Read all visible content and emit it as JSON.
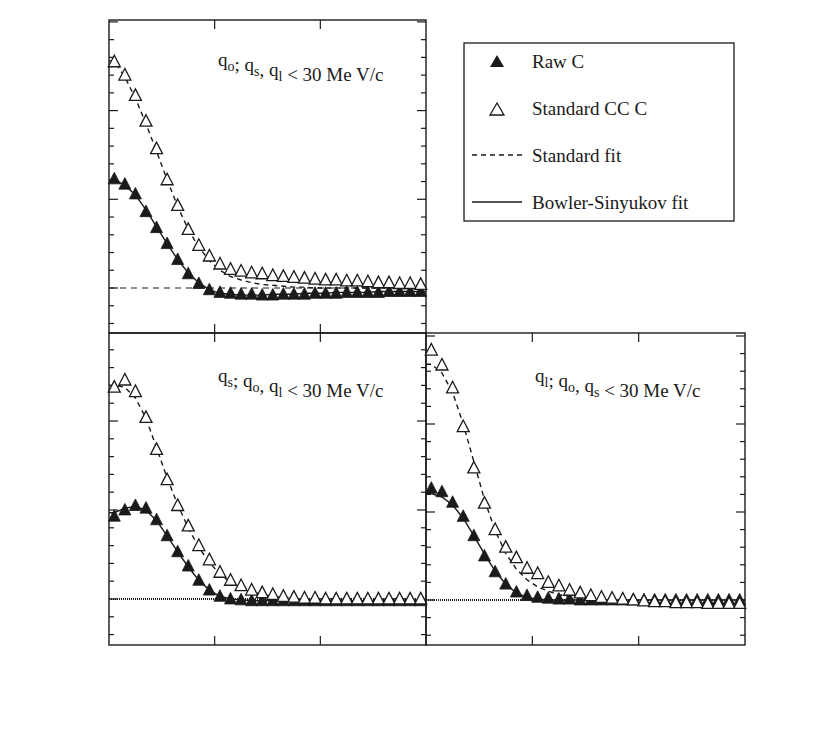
{
  "figure": {
    "legend": {
      "items": [
        {
          "label": "Raw C",
          "marker": "filled-triangle"
        },
        {
          "label": "Standard CC C",
          "marker": "open-triangle"
        },
        {
          "label": "Standard fit",
          "marker": "dashed-line"
        },
        {
          "label": "Bowler-Sinyukov fit",
          "marker": "solid-line"
        }
      ]
    },
    "colors": {
      "ink": "#1a1a1a",
      "background": "#ffffff"
    }
  },
  "chart_data": [
    {
      "type": "scatter",
      "panel": "top-left",
      "annotation": "q_o; q_s, q_l < 30 Me V/c",
      "xlabel": "",
      "ylabel": "C",
      "xlim": [
        0,
        0.15
      ],
      "ylim": [
        0.95,
        1.3
      ],
      "yticks": [
        "1",
        "1.1",
        "1.2",
        "1.3"
      ],
      "xticks": [],
      "reference_line": {
        "y": 1.0,
        "style": "dashed"
      },
      "x": [
        0.0025,
        0.0075,
        0.0125,
        0.0175,
        0.0225,
        0.0275,
        0.0325,
        0.0375,
        0.0425,
        0.0475,
        0.0525,
        0.0575,
        0.0625,
        0.0675,
        0.0725,
        0.0775,
        0.0825,
        0.0875,
        0.0925,
        0.0975,
        0.1025,
        0.1075,
        0.1125,
        0.1175,
        0.1225,
        0.1275,
        0.1325,
        0.1375,
        0.1425,
        0.1475
      ],
      "series": [
        {
          "name": "Raw C",
          "marker": "filled-triangle",
          "values": [
            1.123,
            1.117,
            1.106,
            1.086,
            1.068,
            1.05,
            1.032,
            1.016,
            1.005,
            0.998,
            0.995,
            0.994,
            0.993,
            0.993,
            0.992,
            0.992,
            0.993,
            0.993,
            0.993,
            0.994,
            0.994,
            0.994,
            0.995,
            0.995,
            0.995,
            0.995,
            0.996,
            0.996,
            0.996,
            0.996
          ]
        },
        {
          "name": "Standard CC C",
          "marker": "open-triangle",
          "values": [
            1.255,
            1.24,
            1.217,
            1.188,
            1.157,
            1.122,
            1.093,
            1.066,
            1.048,
            1.036,
            1.027,
            1.021,
            1.019,
            1.017,
            1.016,
            1.014,
            1.013,
            1.012,
            1.011,
            1.01,
            1.009,
            1.009,
            1.008,
            1.008,
            1.007,
            1.006,
            1.006,
            1.005,
            1.005,
            1.004
          ]
        },
        {
          "name": "Standard fit",
          "line": "dashed",
          "fits": "Standard CC C",
          "values": [
            1.256,
            1.238,
            1.214,
            1.185,
            1.154,
            1.122,
            1.092,
            1.066,
            1.046,
            1.031,
            1.02,
            1.013,
            1.009,
            1.006,
            1.004,
            1.003,
            1.002,
            1.001,
            1.001,
            1.0,
            1.0,
            1.0,
            1.0,
            1.0,
            1.0,
            1.0,
            1.0,
            1.0,
            1.0,
            1.0
          ]
        },
        {
          "name": "Bowler-Sinyukov fit",
          "line": "solid",
          "fits": "Raw C",
          "values": [
            1.122,
            1.116,
            1.105,
            1.088,
            1.069,
            1.05,
            1.032,
            1.017,
            1.006,
            0.998,
            0.994,
            0.993,
            0.992,
            0.992,
            0.992,
            0.993,
            0.993,
            0.993,
            0.994,
            0.994,
            0.994,
            0.995,
            0.995,
            0.995,
            0.995,
            0.996,
            0.996,
            0.996,
            0.996,
            0.996
          ]
        }
      ]
    },
    {
      "type": "scatter",
      "panel": "bottom-left",
      "annotation": "q_s; q_o, q_l < 30 Me V/c",
      "xlabel": "q (GeV/c)",
      "ylabel": "C",
      "xlim": [
        0,
        0.15
      ],
      "ylim": [
        0.95,
        1.3
      ],
      "yticks": [
        "1",
        "1.1",
        "1.2"
      ],
      "xticks": [
        "0",
        "0.05",
        "0.1"
      ],
      "reference_line": {
        "y": 1.0,
        "style": "dotted"
      },
      "x": [
        0.0025,
        0.0075,
        0.0125,
        0.0175,
        0.0225,
        0.0275,
        0.0325,
        0.0375,
        0.0425,
        0.0475,
        0.0525,
        0.0575,
        0.0625,
        0.0675,
        0.0725,
        0.0775,
        0.0825,
        0.0875,
        0.0925,
        0.0975,
        0.1025,
        0.1075,
        0.1125,
        0.1175,
        0.1225,
        0.1275,
        0.1325,
        0.1375,
        0.1425,
        0.1475
      ],
      "series": [
        {
          "name": "Raw C",
          "marker": "filled-triangle",
          "values": [
            1.093,
            1.1,
            1.105,
            1.102,
            1.089,
            1.071,
            1.053,
            1.037,
            1.021,
            1.01,
            1.003,
            1.0,
            0.999,
            0.998,
            0.998,
            0.998,
            0.998,
            0.998,
            0.998,
            0.998,
            0.998,
            0.998,
            0.998,
            0.998,
            0.998,
            0.998,
            0.998,
            0.998,
            0.998,
            0.998
          ]
        },
        {
          "name": "Standard CC C",
          "marker": "open-triangle",
          "values": [
            1.238,
            1.246,
            1.233,
            1.204,
            1.168,
            1.134,
            1.105,
            1.082,
            1.06,
            1.044,
            1.03,
            1.021,
            1.015,
            1.01,
            1.007,
            1.005,
            1.003,
            1.002,
            1.001,
            1.001,
            1.0,
            1.0,
            1.0,
            1.0,
            1.0,
            1.0,
            1.0,
            1.0,
            1.0,
            1.0
          ]
        },
        {
          "name": "Standard fit",
          "line": "dashed",
          "fits": "Standard CC C",
          "values": [
            1.24,
            1.238,
            1.226,
            1.203,
            1.17,
            1.136,
            1.106,
            1.08,
            1.058,
            1.041,
            1.028,
            1.019,
            1.012,
            1.008,
            1.005,
            1.003,
            1.002,
            1.001,
            1.0,
            1.0,
            1.0,
            1.0,
            1.0,
            1.0,
            1.0,
            1.0,
            1.0,
            1.0,
            1.0,
            1.0
          ]
        },
        {
          "name": "Bowler-Sinyukov fit",
          "line": "solid",
          "fits": "Raw C",
          "values": [
            1.097,
            1.102,
            1.104,
            1.1,
            1.088,
            1.071,
            1.053,
            1.036,
            1.021,
            1.01,
            1.003,
            1.0,
            0.999,
            0.998,
            0.998,
            0.998,
            0.998,
            0.998,
            0.998,
            0.998,
            0.998,
            0.998,
            0.998,
            0.998,
            0.998,
            0.998,
            0.998,
            0.998,
            0.998,
            0.998
          ]
        }
      ]
    },
    {
      "type": "scatter",
      "panel": "bottom-right",
      "annotation": "q_l; q_o, q_s < 30 Me V/c",
      "xlabel": "q (GeV/c)",
      "ylabel": "C",
      "ylabel_side": "right",
      "xlim": [
        0,
        0.15
      ],
      "ylim": [
        0.95,
        1.3
      ],
      "yticks": [
        "1",
        "1.1",
        "1.2"
      ],
      "xticks": [
        "0",
        "0.05",
        "0.1",
        "0.15"
      ],
      "reference_line": {
        "y": 1.0,
        "style": "dotted"
      },
      "x": [
        0.0025,
        0.0075,
        0.0125,
        0.0175,
        0.0225,
        0.0275,
        0.0325,
        0.0375,
        0.0425,
        0.0475,
        0.0525,
        0.0575,
        0.0625,
        0.0675,
        0.0725,
        0.0775,
        0.0825,
        0.0875,
        0.0925,
        0.0975,
        0.1025,
        0.1075,
        0.1125,
        0.1175,
        0.1225,
        0.1275,
        0.1325,
        0.1375,
        0.1425,
        0.1475
      ],
      "series": [
        {
          "name": "Raw C",
          "marker": "filled-triangle",
          "values": [
            1.127,
            1.123,
            1.111,
            1.095,
            1.073,
            1.05,
            1.032,
            1.018,
            1.009,
            1.005,
            1.003,
            1.002,
            1.001,
            1.001,
            1.0,
            1.0,
            1.0,
            1.0,
            1.0,
            1.0,
            1.0,
            1.0,
            1.0,
            1.0,
            1.0,
            1.0,
            1.0,
            1.0,
            1.0,
            1.0
          ]
        },
        {
          "name": "Standard CC C",
          "marker": "open-triangle",
          "values": [
            1.284,
            1.267,
            1.241,
            1.197,
            1.15,
            1.11,
            1.08,
            1.06,
            1.048,
            1.036,
            1.03,
            1.02,
            1.016,
            1.011,
            1.008,
            1.005,
            1.003,
            1.002,
            1.001,
            1.0,
            0.999,
            0.998,
            0.998,
            0.997,
            0.997,
            0.997,
            0.996,
            0.996,
            0.996,
            0.996
          ]
        },
        {
          "name": "Standard fit",
          "line": "dashed",
          "fits": "Standard CC C",
          "values": [
            1.268,
            1.258,
            1.236,
            1.2,
            1.157,
            1.114,
            1.079,
            1.053,
            1.035,
            1.023,
            1.015,
            1.01,
            1.006,
            1.004,
            1.002,
            1.001,
            1.0,
            0.999,
            0.998,
            0.998,
            0.997,
            0.997,
            0.997,
            0.996,
            0.996,
            0.996,
            0.996,
            0.996,
            0.996,
            0.996
          ]
        },
        {
          "name": "Bowler-Sinyukov fit",
          "line": "solid",
          "fits": "Raw C",
          "values": [
            1.121,
            1.117,
            1.108,
            1.093,
            1.073,
            1.052,
            1.033,
            1.018,
            1.008,
            1.003,
            1.001,
            1.0,
            1.0,
            1.0,
            1.0,
            1.0,
            1.0,
            1.0,
            1.0,
            1.0,
            1.0,
            1.0,
            1.0,
            1.0,
            1.0,
            1.0,
            1.0,
            1.0,
            1.0,
            1.0
          ]
        }
      ]
    }
  ]
}
